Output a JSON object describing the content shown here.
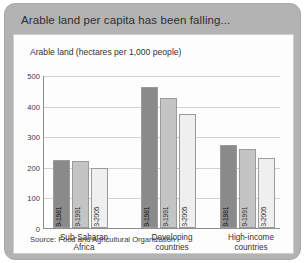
{
  "card": {
    "title": "Arable land per capita has been falling...",
    "subtitle": "Arable land (hectares per 1,000 people)",
    "source": "Source: Food and Agricultural Organization"
  },
  "chart_data": {
    "type": "bar",
    "title": "Arable land per capita has been falling...",
    "subtitle": "Arable land (hectares per 1,000 people)",
    "xlabel": "",
    "ylabel": "Arable land (hectares per 1,000 people)",
    "ylim": [
      0,
      500
    ],
    "yticks": [
      0,
      100,
      200,
      300,
      400,
      500
    ],
    "grid": true,
    "legend_position": "none",
    "annotation": "Source: Food and Agricultural Organization",
    "categories": [
      "Sub-Saharan Africa",
      "Developing countries",
      "High-income countries"
    ],
    "series": [
      {
        "name": "1979-1981",
        "color": "#8a8a8a",
        "values": [
          222,
          460,
          270
        ]
      },
      {
        "name": "1989-1991",
        "color": "#c4c4c4",
        "values": [
          220,
          425,
          257
        ]
      },
      {
        "name": "2003-2005",
        "color": "#efefef",
        "values": [
          197,
          373,
          228
        ]
      }
    ],
    "groups": [
      {
        "label_line1": "Sub-Saharan",
        "label_line2": "Africa",
        "bars": [
          {
            "label": "1979-1981",
            "value": 222,
            "color": "#8a8a8a"
          },
          {
            "label": "1989-1991",
            "value": 220,
            "color": "#c4c4c4"
          },
          {
            "label": "2003-2005",
            "value": 197,
            "color": "#efefef"
          }
        ]
      },
      {
        "label_line1": "Developing",
        "label_line2": "countries",
        "bars": [
          {
            "label": "1979-1981",
            "value": 460,
            "color": "#8a8a8a"
          },
          {
            "label": "1989-1991",
            "value": 425,
            "color": "#c4c4c4"
          },
          {
            "label": "2003-2005",
            "value": 373,
            "color": "#efefef"
          }
        ]
      },
      {
        "label_line1": "High-income",
        "label_line2": "countries",
        "bars": [
          {
            "label": "1979-1981",
            "value": 270,
            "color": "#8a8a8a"
          },
          {
            "label": "1989-1991",
            "value": 257,
            "color": "#c4c4c4"
          },
          {
            "label": "2003-2005",
            "value": 228,
            "color": "#efefef"
          }
        ]
      }
    ]
  }
}
